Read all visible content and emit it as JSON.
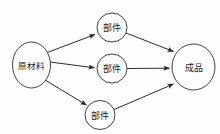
{
  "diagram": {
    "type": "directed-graph",
    "title": "",
    "background_color": "#fdfdfd",
    "stroke_color": "#2b2b2b",
    "nodes": [
      {
        "id": "raw-material",
        "label": "原材料",
        "shape": "ellipse",
        "cx": 31.5,
        "cy": 65,
        "rx": 19,
        "ry": 23
      },
      {
        "id": "part-top",
        "label": "部件",
        "shape": "circle",
        "cx": 112,
        "cy": 27.5,
        "rx": 15,
        "ry": 14.5
      },
      {
        "id": "part-middle",
        "label": "部件",
        "shape": "circle",
        "cx": 112,
        "cy": 68.5,
        "rx": 15,
        "ry": 14.5
      },
      {
        "id": "part-bottom",
        "label": "部件",
        "shape": "circle",
        "cx": 100,
        "cy": 115,
        "rx": 15,
        "ry": 14.5
      },
      {
        "id": "finished-product",
        "label": "成品",
        "shape": "ellipse",
        "cx": 193.5,
        "cy": 67,
        "rx": 21.5,
        "ry": 23
      }
    ],
    "edges": [
      {
        "id": "edge-raw-to-top",
        "from": "raw-material",
        "to": "part-top",
        "x1": 46,
        "y1": 53,
        "x2": 97,
        "y2": 34
      },
      {
        "id": "edge-raw-to-middle",
        "from": "raw-material",
        "to": "part-middle",
        "x1": 50,
        "y1": 62,
        "x2": 96,
        "y2": 68
      },
      {
        "id": "edge-raw-to-bottom",
        "from": "raw-material",
        "to": "part-bottom",
        "x1": 45,
        "y1": 80,
        "x2": 88,
        "y2": 106
      },
      {
        "id": "edge-top-to-final",
        "from": "part-top",
        "to": "finished-product",
        "x1": 126,
        "y1": 33,
        "x2": 175,
        "y2": 52
      },
      {
        "id": "edge-mid-to-final",
        "from": "part-middle",
        "to": "finished-product",
        "x1": 127,
        "y1": 68.5,
        "x2": 171,
        "y2": 68
      },
      {
        "id": "edge-bot-to-final",
        "from": "part-bottom",
        "to": "finished-product",
        "x1": 113,
        "y1": 110,
        "x2": 175,
        "y2": 83
      }
    ]
  }
}
